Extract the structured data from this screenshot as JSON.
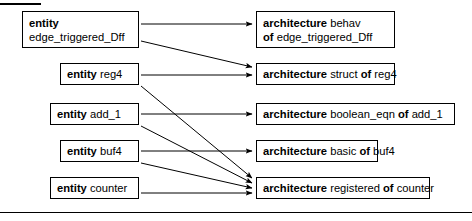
{
  "figure": {
    "width": 472,
    "height": 221,
    "background": "#ffffff",
    "line_color": "#000000",
    "rules": {
      "top_rule": "",
      "bottom_rule": ""
    }
  },
  "entities": [
    {
      "id": "entity-edge-triggered-dff",
      "keyword": "entity",
      "name": "edge_triggered_Dff",
      "two_line": true,
      "line1_kw": "entity",
      "line1_arg": "",
      "line2_kw": "",
      "line2_arg": "edge_triggered_Dff",
      "box": {
        "x": 22,
        "y": 11,
        "w": 117,
        "h": 37
      }
    },
    {
      "id": "entity-reg4",
      "keyword": "entity",
      "name": "reg4",
      "two_line": false,
      "line1_kw": "entity",
      "line1_arg": " reg4",
      "line2_kw": "",
      "line2_arg": "",
      "box": {
        "x": 60,
        "y": 63,
        "w": 79,
        "h": 22
      }
    },
    {
      "id": "entity-add-1",
      "keyword": "entity",
      "name": "add_1",
      "two_line": false,
      "line1_kw": "entity",
      "line1_arg": " add_1",
      "line2_kw": "",
      "line2_arg": "",
      "box": {
        "x": 50,
        "y": 103,
        "w": 89,
        "h": 22
      }
    },
    {
      "id": "entity-buf4",
      "keyword": "entity",
      "name": "buf4",
      "two_line": false,
      "line1_kw": "entity",
      "line1_arg": " buf4",
      "line2_kw": "",
      "line2_arg": "",
      "box": {
        "x": 60,
        "y": 140,
        "w": 79,
        "h": 22
      }
    },
    {
      "id": "entity-counter",
      "keyword": "entity",
      "name": "counter",
      "two_line": false,
      "line1_kw": "entity",
      "line1_arg": " counter",
      "line2_kw": "",
      "line2_arg": "",
      "box": {
        "x": 50,
        "y": 177,
        "w": 89,
        "h": 22
      }
    }
  ],
  "architectures": [
    {
      "id": "architecture-behav-dff",
      "two_line": true,
      "line1_kw": "architecture",
      "line1_arg": " behav",
      "line2_kw": "of",
      "line2_arg": " edge_triggered_Dff",
      "box": {
        "x": 256,
        "y": 11,
        "w": 139,
        "h": 37
      }
    },
    {
      "id": "architecture-struct-reg4",
      "two_line": false,
      "line1_kw": "architecture",
      "line1_arg": " struct ",
      "line1_kw2": "of",
      "line1_arg2": " reg4",
      "box": {
        "x": 256,
        "y": 63,
        "w": 139,
        "h": 22
      }
    },
    {
      "id": "architecture-boolean-eqn-add-1",
      "two_line": false,
      "line1_kw": "architecture",
      "line1_arg": " boolean_eqn ",
      "line1_kw2": "of",
      "line1_arg2": " add_1",
      "box": {
        "x": 256,
        "y": 103,
        "w": 199,
        "h": 22
      }
    },
    {
      "id": "architecture-basic-buf4",
      "two_line": false,
      "line1_kw": "architecture",
      "line1_arg": " basic ",
      "line1_kw2": "of",
      "line1_arg2": " buf4",
      "box": {
        "x": 256,
        "y": 140,
        "w": 122,
        "h": 22
      }
    },
    {
      "id": "architecture-registered-counter",
      "two_line": false,
      "line1_kw": "architecture",
      "line1_arg": " registered ",
      "line1_kw2": "of",
      "line1_arg2": " counter",
      "box": {
        "x": 256,
        "y": 177,
        "w": 174,
        "h": 22
      }
    }
  ],
  "arrows": [
    {
      "id": "arrow-dff-to-behav",
      "from": "entity-edge-triggered-dff",
      "to": "architecture-behav-dff",
      "x1": 141,
      "y1": 24,
      "x2": 252,
      "y2": 24
    },
    {
      "id": "arrow-dff-to-struct",
      "from": "entity-edge-triggered-dff",
      "to": "architecture-struct-reg4",
      "x1": 141,
      "y1": 41,
      "x2": 252,
      "y2": 67
    },
    {
      "id": "arrow-reg4-to-struct",
      "from": "entity-reg4",
      "to": "architecture-struct-reg4",
      "x1": 141,
      "y1": 75,
      "x2": 252,
      "y2": 75
    },
    {
      "id": "arrow-reg4-to-registered",
      "from": "entity-reg4",
      "to": "architecture-registered-counter",
      "x1": 141,
      "y1": 86,
      "x2": 252,
      "y2": 178
    },
    {
      "id": "arrow-add1-to-boolean-eqn",
      "from": "entity-add-1",
      "to": "architecture-boolean-eqn-add-1",
      "x1": 141,
      "y1": 114,
      "x2": 252,
      "y2": 114
    },
    {
      "id": "arrow-add1-to-registered",
      "from": "entity-add-1",
      "to": "architecture-registered-counter",
      "x1": 141,
      "y1": 126,
      "x2": 252,
      "y2": 183
    },
    {
      "id": "arrow-buf4-to-basic",
      "from": "entity-buf4",
      "to": "architecture-basic-buf4",
      "x1": 141,
      "y1": 151,
      "x2": 252,
      "y2": 151
    },
    {
      "id": "arrow-buf4-to-registered",
      "from": "entity-buf4",
      "to": "architecture-registered-counter",
      "x1": 141,
      "y1": 163,
      "x2": 252,
      "y2": 188
    },
    {
      "id": "arrow-counter-to-registered",
      "from": "entity-counter",
      "to": "architecture-registered-counter",
      "x1": 141,
      "y1": 193,
      "x2": 252,
      "y2": 193
    }
  ]
}
